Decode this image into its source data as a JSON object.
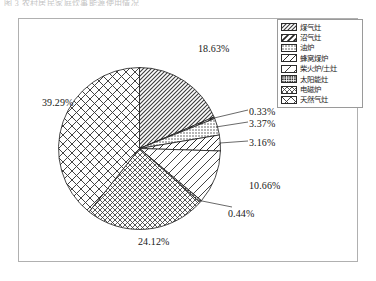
{
  "document": {
    "top_fragment": "图 3  农村居民家庭炊事能源使用情况"
  },
  "chart_data": {
    "type": "pie",
    "title": "",
    "subtitle": "",
    "xlabel": "",
    "ylabel": "",
    "grid": false,
    "legend_position": "top-right",
    "units": "%",
    "start_angle_deg": 0,
    "direction": "clockwise",
    "categories": [
      "煤气灶",
      "沼气灶",
      "油炉",
      "蜂窝煤炉",
      "柴火炉/土灶",
      "太阳能灶",
      "电磁炉",
      "天然气灶"
    ],
    "values": [
      18.63,
      0.33,
      3.37,
      3.16,
      10.66,
      0.44,
      24.12,
      39.29
    ],
    "value_labels": [
      "18.63%",
      "0.33%",
      "3.37%",
      "3.16%",
      "10.66%",
      "0.44%",
      "24.12%",
      "39.29%"
    ],
    "total": 100.0,
    "patterns": [
      "diagonal-hatch-fine",
      "diagonal-stripe-wide",
      "dot-grid-fine",
      "diagonal-line-medium",
      "diagonal-line-sparse",
      "dot-grid-dense",
      "crosshatch-small",
      "crosshatch-large"
    ]
  },
  "legend": {
    "items": [
      {
        "label": "煤气灶",
        "pattern": "diagonal-hatch-fine"
      },
      {
        "label": "沼气灶",
        "pattern": "diagonal-stripe-wide"
      },
      {
        "label": "油炉",
        "pattern": "dot-grid-fine"
      },
      {
        "label": "蜂窝煤炉",
        "pattern": "diagonal-line-medium"
      },
      {
        "label": "柴火炉/土灶",
        "pattern": "diagonal-line-sparse"
      },
      {
        "label": "太阳能灶",
        "pattern": "dot-grid-dense"
      },
      {
        "label": "电磁炉",
        "pattern": "crosshatch-small"
      },
      {
        "label": "天然气灶",
        "pattern": "crosshatch-large"
      }
    ]
  }
}
